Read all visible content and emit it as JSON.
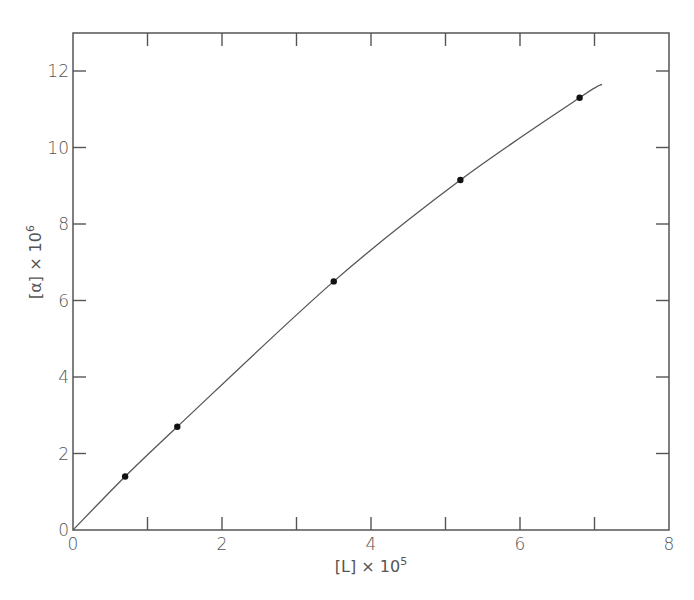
{
  "chart_data": {
    "type": "line",
    "title": "",
    "xlabel": "[L] × 10^5",
    "ylabel": "[α] × 10^6",
    "xlabel_parts": {
      "base": "[L] × 10",
      "exp": "5"
    },
    "ylabel_parts": {
      "base": "[α] × 10",
      "exp": "6"
    },
    "xlim": [
      0,
      8
    ],
    "ylim": [
      0,
      13
    ],
    "x_ticks": [
      0,
      2,
      4,
      6,
      8
    ],
    "x_minor_ticks": [
      1,
      3,
      5,
      7
    ],
    "y_ticks": [
      0,
      2,
      4,
      6,
      8,
      10,
      12
    ],
    "grid": false,
    "legend": null,
    "series": [
      {
        "name": "measured",
        "kind": "scatter",
        "marker": "filled-circle",
        "x": [
          0.7,
          1.4,
          3.5,
          5.2,
          6.8
        ],
        "y": [
          1.4,
          2.7,
          6.5,
          9.15,
          11.3
        ]
      },
      {
        "name": "fitted curve",
        "kind": "line",
        "x": [
          0,
          0.7,
          1.4,
          3.5,
          5.2,
          6.8,
          7.1
        ],
        "y": [
          0,
          1.4,
          2.7,
          6.5,
          9.15,
          11.3,
          11.65
        ]
      }
    ]
  },
  "colors": {
    "axis": "#555555",
    "curve": "#555555",
    "marker": "#111111",
    "background": "#ffffff"
  }
}
